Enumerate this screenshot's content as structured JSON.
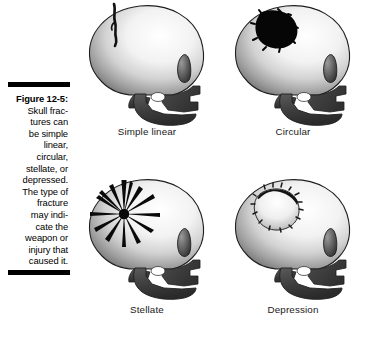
{
  "figure": {
    "label": "Figure 12-5:",
    "caption_lines": [
      "Skull frac-",
      "tures can",
      "be simple",
      "linear,",
      "circular,",
      "stellate, or",
      "depressed.",
      "The type of",
      "fracture",
      "may indi-",
      "cate the",
      "weapon or",
      "injury that",
      "caused it."
    ],
    "caption_full": "Skull fractures can be simple linear, circular, stellate, or depressed. The type of fracture may indicate the weapon or injury that caused it.",
    "rule_color": "#000000"
  },
  "panels": [
    {
      "id": "simple-linear",
      "label": "Simple linear",
      "fracture_type": "linear",
      "description": "thin wavy crack line on upper cranium"
    },
    {
      "id": "circular",
      "label": "Circular",
      "fracture_type": "circular",
      "description": "solid black irregular round hole punched through cranium"
    },
    {
      "id": "stellate",
      "label": "Stellate",
      "fracture_type": "stellate",
      "description": "starburst of radiating tapered fracture lines"
    },
    {
      "id": "depression",
      "label": "Depression",
      "fracture_type": "depression",
      "description": "round depressed area with dark jagged rim"
    }
  ],
  "colors": {
    "background": "#ffffff",
    "bone_light": "#ffffff",
    "bone_mid": "#c9c9c9",
    "bone_shadow": "#6e6e6e",
    "jaw_dark": "#3a3a3a",
    "outline": "#1a1a1a",
    "fracture_black": "#000000",
    "label_text": "#1a1a1a"
  }
}
